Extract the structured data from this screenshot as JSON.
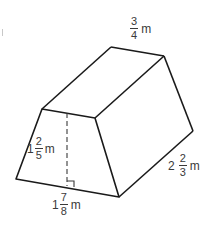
{
  "diagram": {
    "type": "trapezoidal-prism",
    "stroke_color": "#1a1a1a",
    "label_color": "#3a3a3a",
    "vertices": {
      "front_top_left": [
        42,
        109
      ],
      "front_top_right": [
        95,
        118
      ],
      "front_bottom_left": [
        16,
        179
      ],
      "front_bottom_right": [
        119,
        197
      ],
      "back_top_left": [
        111,
        47
      ],
      "back_top_right": [
        164,
        56
      ],
      "back_bottom_right": [
        193,
        131
      ]
    },
    "height_line": {
      "x": 67,
      "y1": 113,
      "y2": 186,
      "style": "dashed"
    },
    "labels": {
      "top_width": {
        "whole": "",
        "num": "3",
        "den": "4",
        "unit": "m"
      },
      "height": {
        "whole": "1",
        "num": "2",
        "den": "5",
        "unit": "m"
      },
      "bottom_width": {
        "whole": "1",
        "num": "7",
        "den": "8",
        "unit": "m"
      },
      "length": {
        "whole": "2",
        "num": "2",
        "den": "3",
        "unit": "m"
      }
    }
  }
}
